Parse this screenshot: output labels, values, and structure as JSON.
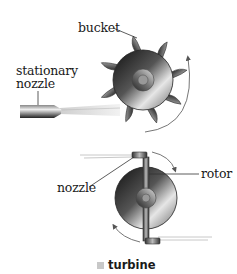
{
  "figure": {
    "caption": "turbine",
    "top_diagram": {
      "labels": {
        "bucket": "bucket",
        "stationary_nozzle_line1": "stationary",
        "stationary_nozzle_line2": "nozzle"
      }
    },
    "bottom_diagram": {
      "labels": {
        "nozzle": "nozzle",
        "rotor": "rotor"
      }
    },
    "colors": {
      "metal_dark": "#1e1e1e",
      "metal_light": "#d8d8d8",
      "caption_square": "#c8c8c8",
      "text": "#1a1a1a"
    }
  }
}
